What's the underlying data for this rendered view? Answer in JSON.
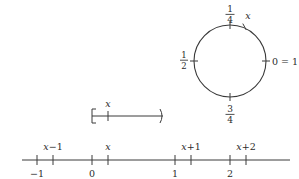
{
  "figure": {
    "stroke_color": "#3a3a3a",
    "text_color": "#2b2b2b",
    "background": "#ffffff"
  },
  "circle": {
    "center_x": 230,
    "center_y": 61,
    "radius": 36,
    "labels": {
      "top_numerator": "1",
      "top_denominator": "4",
      "left_numerator": "1",
      "left_denominator": "2",
      "bottom_numerator": "3",
      "bottom_denominator": "4",
      "right": "0 = 1",
      "point": "x"
    },
    "tick_positions_turns": [
      0,
      0.25,
      0.5,
      0.75
    ],
    "point_position_turns": 0.21
  },
  "interval": {
    "left_bracket": "[",
    "right_bracket": ")",
    "point_label": "x",
    "x_start": 92,
    "x_end": 163,
    "y": 116,
    "point_x": 108
  },
  "number_line": {
    "y": 160,
    "x_start": 22,
    "x_end": 290,
    "integer_ticks": [
      {
        "label": "-1",
        "x": 37
      },
      {
        "label": "0",
        "x": 92
      },
      {
        "label": "1",
        "x": 175
      },
      {
        "label": "2",
        "x": 230
      }
    ],
    "offset_ticks": [
      {
        "label": "x-1",
        "x": 53
      },
      {
        "label": "x",
        "x": 108
      },
      {
        "label": "x+1",
        "x": 191
      },
      {
        "label": "x+2",
        "x": 246
      }
    ],
    "offset_labels_parts": [
      {
        "base": "x",
        "suffix": "−1"
      },
      {
        "base": "x",
        "suffix": ""
      },
      {
        "base": "x",
        "suffix": "+1"
      },
      {
        "base": "x",
        "suffix": "+2"
      }
    ],
    "integer_labels_text": [
      "−1",
      "0",
      "1",
      "2"
    ]
  }
}
